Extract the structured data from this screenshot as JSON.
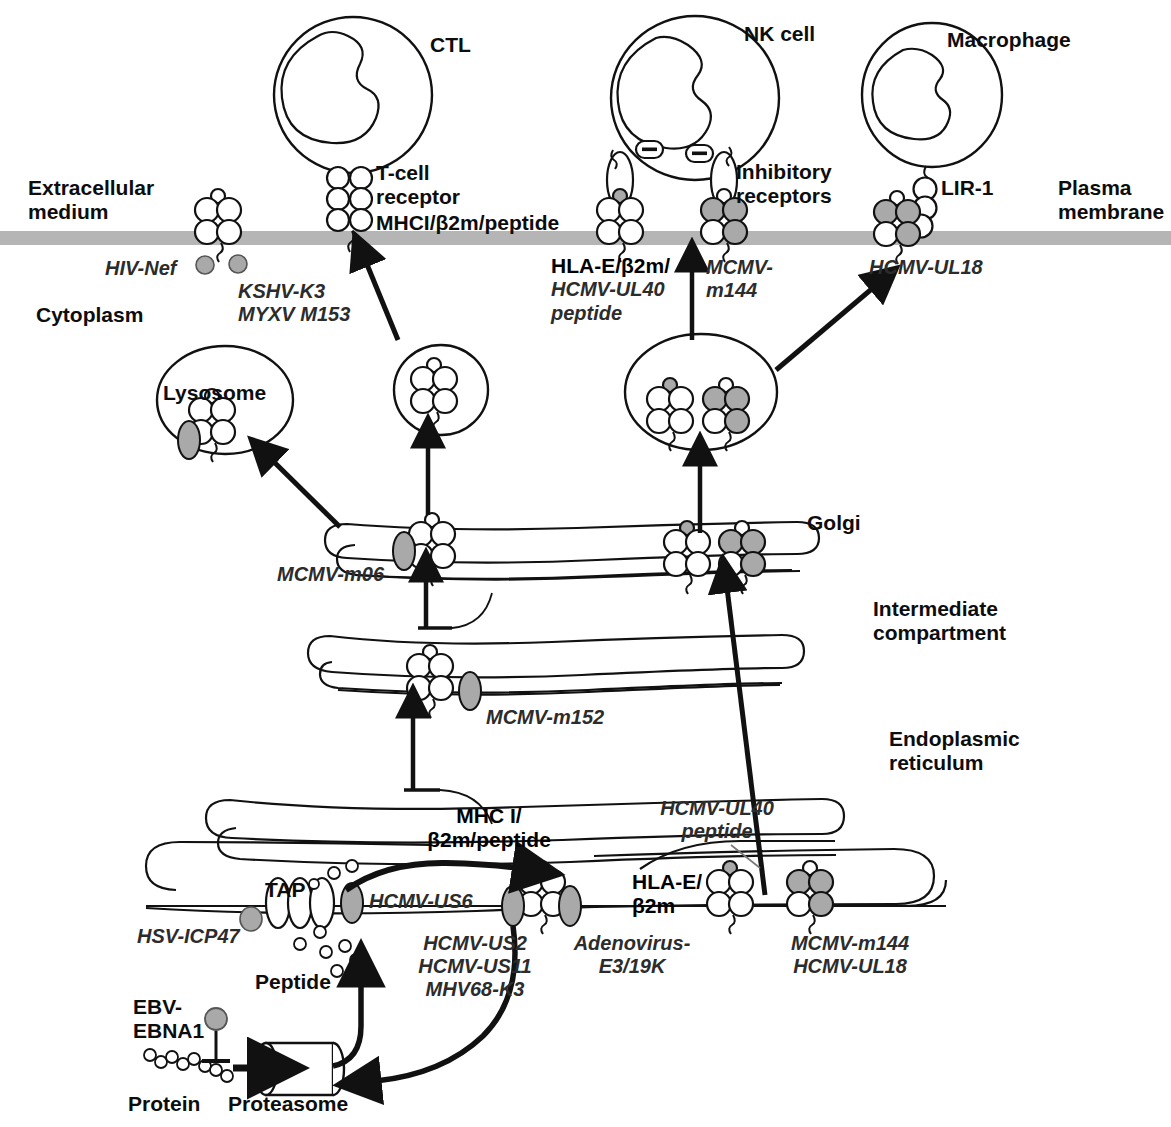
{
  "figure": {
    "type": "cell-biology-diagram"
  },
  "compartment_labels": {
    "extracellular": "Extracellular\nmedium",
    "cytoplasm": "Cytoplasm",
    "plasma_membrane": "Plasma\nmembrane",
    "lysosome": "Lysosome",
    "golgi": "Golgi",
    "intermediate_compartment": "Intermediate\ncompartment",
    "endoplasmic_reticulum": "Endoplasmic\nreticulum"
  },
  "cells": {
    "ctl": "CTL",
    "nk": "NK cell",
    "macrophage": "Macrophage"
  },
  "receptor_labels": {
    "tcr": "T-cell\nreceptor",
    "mhc_complex_surface": "MHCI/β2m/peptide",
    "inhibitory_receptors": "Inhibitory\nreceptors",
    "lir1": "LIR-1",
    "hla_e_surface": "HLA-E/β2m/",
    "hla_e_surface_2": "HCMV-UL40",
    "hla_e_surface_3": "peptide",
    "tap": "TAP",
    "mhc_er": "MHC I/\nβ2m/peptide",
    "hla_e_er": "HLA-E/\nβ2m",
    "hcmv_ul40_peptide": "HCMV-UL40\npeptide",
    "peptide": "Peptide",
    "protein": "Protein",
    "proteasome": "Proteasome"
  },
  "viral_proteins": [
    {
      "id": "hiv-nef",
      "text": "HIV-Nef"
    },
    {
      "id": "kshv-k3",
      "text": "KSHV-K3\nMYXV M153"
    },
    {
      "id": "mcmv-m144-surf",
      "text": "MCMV-\nm144"
    },
    {
      "id": "hcmv-ul18-surf",
      "text": "HCMV-UL18"
    },
    {
      "id": "mcmv-m06",
      "text": "MCMV-m06"
    },
    {
      "id": "mcmv-m152",
      "text": "MCMV-m152"
    },
    {
      "id": "hsv-icp47",
      "text": "HSV-ICP47"
    },
    {
      "id": "hcmv-us6",
      "text": "HCMV-US6"
    },
    {
      "id": "hcmv-us2",
      "text": "HCMV-US2\nHCMV-US11\nMHV68-K3"
    },
    {
      "id": "adenovirus-e3",
      "text": "Adenovirus-\nE3/19K"
    },
    {
      "id": "mcmv-m144-er",
      "text": "MCMV-m144\nHCMV-UL18"
    },
    {
      "id": "ebv-ebna1",
      "text": "EBV-\nEBNA1"
    }
  ],
  "colors": {
    "stroke": "#111111",
    "membrane_gray": "#b5b5b5",
    "shaded_fill": "#a9a9a9",
    "white_fill": "#ffffff",
    "text": "#111111",
    "italic_text": "#2c2c2c"
  },
  "icon_glyphs": {
    "inhibitory_minus": "–"
  }
}
